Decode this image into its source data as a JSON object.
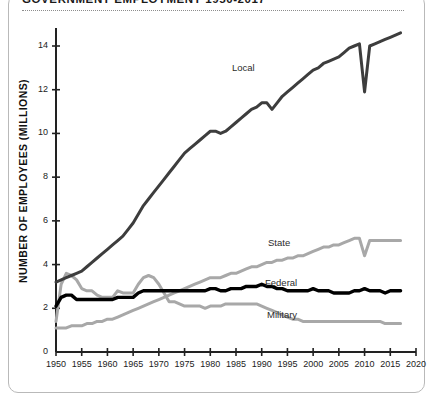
{
  "title": "GOVERNMENT EMPLOYMENT 1950-2017",
  "axes": {
    "ylabel": "NUMBER OF EMPLOYEES (MILLIONS)",
    "yticks": [
      "0",
      "2",
      "4",
      "6",
      "8",
      "10",
      "12",
      "14"
    ],
    "xticks": [
      "1950",
      "1955",
      "1960",
      "1965",
      "1970",
      "1975",
      "1980",
      "1985",
      "1990",
      "1995",
      "2000",
      "2005",
      "2010",
      "2015",
      "2020"
    ]
  },
  "labels": {
    "local": "Local",
    "state": "State",
    "federal": "Federal",
    "military": "Military"
  },
  "colors": {
    "local": "#3d3d3d",
    "state": "#a8a8a8",
    "federal": "#000000",
    "military": "#a8a8a8",
    "axis": "#222222",
    "frame": "#b9b9b9",
    "rule": "#8d8d8d"
  },
  "chart_data": {
    "type": "line",
    "title": "GOVERNMENT EMPLOYMENT 1950-2017",
    "xlabel": "",
    "ylabel": "NUMBER OF EMPLOYEES (MILLIONS)",
    "xlim": [
      1950,
      2020
    ],
    "ylim": [
      0,
      15
    ],
    "grid": false,
    "legend": "inline-annotations",
    "x": [
      1950,
      1951,
      1952,
      1953,
      1954,
      1955,
      1956,
      1957,
      1958,
      1959,
      1960,
      1961,
      1962,
      1963,
      1964,
      1965,
      1966,
      1967,
      1968,
      1969,
      1970,
      1971,
      1972,
      1973,
      1974,
      1975,
      1976,
      1977,
      1978,
      1979,
      1980,
      1981,
      1982,
      1983,
      1984,
      1985,
      1986,
      1987,
      1988,
      1989,
      1990,
      1991,
      1992,
      1993,
      1994,
      1995,
      1996,
      1997,
      1998,
      1999,
      2000,
      2001,
      2002,
      2003,
      2004,
      2005,
      2006,
      2007,
      2008,
      2009,
      2010,
      2011,
      2012,
      2013,
      2014,
      2015,
      2016,
      2017
    ],
    "series": [
      {
        "name": "Local",
        "color": "#3d3d3d",
        "values": [
          3.2,
          3.3,
          3.4,
          3.5,
          3.6,
          3.7,
          3.9,
          4.1,
          4.3,
          4.5,
          4.7,
          4.9,
          5.1,
          5.3,
          5.6,
          5.9,
          6.3,
          6.7,
          7.0,
          7.3,
          7.6,
          7.9,
          8.2,
          8.5,
          8.8,
          9.1,
          9.3,
          9.5,
          9.7,
          9.9,
          10.1,
          10.1,
          10.0,
          10.1,
          10.3,
          10.5,
          10.7,
          10.9,
          11.1,
          11.2,
          11.4,
          11.4,
          11.1,
          11.4,
          11.7,
          11.9,
          12.1,
          12.3,
          12.5,
          12.7,
          12.9,
          13.0,
          13.2,
          13.3,
          13.4,
          13.5,
          13.7,
          13.9,
          14.0,
          14.1,
          11.9,
          14.0,
          14.1,
          14.2,
          14.3,
          14.4,
          14.5,
          14.6
        ]
      },
      {
        "name": "State",
        "color": "#a8a8a8",
        "values": [
          1.1,
          1.1,
          1.1,
          1.2,
          1.2,
          1.2,
          1.3,
          1.3,
          1.4,
          1.4,
          1.5,
          1.5,
          1.6,
          1.7,
          1.8,
          1.9,
          2.0,
          2.1,
          2.2,
          2.3,
          2.4,
          2.5,
          2.6,
          2.7,
          2.8,
          2.9,
          3.0,
          3.1,
          3.2,
          3.3,
          3.4,
          3.4,
          3.4,
          3.5,
          3.6,
          3.6,
          3.7,
          3.8,
          3.9,
          3.9,
          4.0,
          4.1,
          4.1,
          4.2,
          4.2,
          4.3,
          4.3,
          4.4,
          4.4,
          4.5,
          4.6,
          4.7,
          4.8,
          4.8,
          4.9,
          4.9,
          5.0,
          5.1,
          5.2,
          5.2,
          4.4,
          5.1,
          5.1,
          5.1,
          5.1,
          5.1,
          5.1,
          5.1
        ]
      },
      {
        "name": "Federal",
        "color": "#000000",
        "values": [
          2.1,
          2.5,
          2.6,
          2.6,
          2.4,
          2.4,
          2.4,
          2.4,
          2.4,
          2.4,
          2.4,
          2.4,
          2.5,
          2.5,
          2.5,
          2.5,
          2.7,
          2.8,
          2.8,
          2.8,
          2.8,
          2.8,
          2.8,
          2.8,
          2.8,
          2.8,
          2.8,
          2.8,
          2.8,
          2.8,
          2.9,
          2.9,
          2.8,
          2.8,
          2.9,
          2.9,
          2.9,
          3.0,
          3.0,
          3.0,
          3.1,
          3.0,
          3.0,
          2.9,
          2.9,
          2.8,
          2.8,
          2.8,
          2.8,
          2.8,
          2.9,
          2.8,
          2.8,
          2.8,
          2.7,
          2.7,
          2.7,
          2.7,
          2.8,
          2.8,
          2.9,
          2.8,
          2.8,
          2.8,
          2.7,
          2.8,
          2.8,
          2.8
        ]
      },
      {
        "name": "Military",
        "color": "#a8a8a8",
        "values": [
          1.4,
          3.1,
          3.6,
          3.5,
          3.3,
          2.9,
          2.8,
          2.8,
          2.6,
          2.5,
          2.5,
          2.5,
          2.8,
          2.7,
          2.7,
          2.7,
          3.1,
          3.4,
          3.5,
          3.4,
          3.1,
          2.7,
          2.3,
          2.3,
          2.2,
          2.1,
          2.1,
          2.1,
          2.1,
          2.0,
          2.1,
          2.1,
          2.1,
          2.2,
          2.2,
          2.2,
          2.2,
          2.2,
          2.2,
          2.2,
          2.1,
          2.0,
          1.9,
          1.8,
          1.7,
          1.6,
          1.5,
          1.5,
          1.4,
          1.4,
          1.4,
          1.4,
          1.4,
          1.4,
          1.4,
          1.4,
          1.4,
          1.4,
          1.4,
          1.4,
          1.4,
          1.4,
          1.4,
          1.4,
          1.3,
          1.3,
          1.3,
          1.3
        ]
      }
    ]
  }
}
